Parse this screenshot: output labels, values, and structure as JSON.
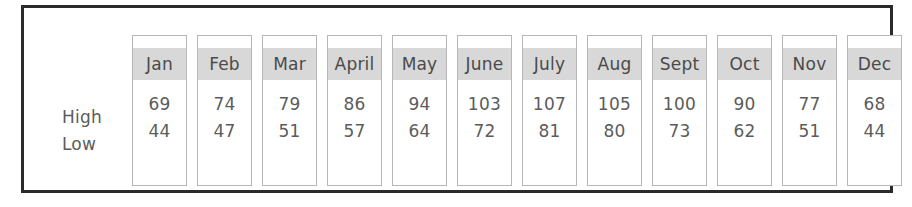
{
  "table": {
    "row_labels": [
      "High",
      "Low"
    ],
    "months": [
      "Jan",
      "Feb",
      "Mar",
      "April",
      "May",
      "June",
      "July",
      "Aug",
      "Sept",
      "Oct",
      "Nov",
      "Dec"
    ],
    "rows": {
      "high": [
        69,
        74,
        79,
        86,
        94,
        103,
        107,
        105,
        100,
        90,
        77,
        68
      ],
      "low": [
        44,
        47,
        51,
        57,
        64,
        72,
        81,
        80,
        73,
        62,
        51,
        44
      ]
    }
  },
  "colors": {
    "frame_border": "#2b2b2b",
    "column_border": "#b7b7b7",
    "header_fill": "#d8d8d8",
    "text": "#5c5c5c",
    "background": "#ffffff"
  },
  "chart_data": {
    "type": "table",
    "title": "",
    "categories": [
      "Jan",
      "Feb",
      "Mar",
      "April",
      "May",
      "June",
      "July",
      "Aug",
      "Sept",
      "Oct",
      "Nov",
      "Dec"
    ],
    "series": [
      {
        "name": "High",
        "values": [
          69,
          74,
          79,
          86,
          94,
          103,
          107,
          105,
          100,
          90,
          77,
          68
        ]
      },
      {
        "name": "Low",
        "values": [
          44,
          47,
          51,
          57,
          64,
          72,
          81,
          80,
          73,
          62,
          51,
          44
        ]
      }
    ],
    "xlabel": "",
    "ylabel": "",
    "legend": [
      "High",
      "Low"
    ],
    "grid": false
  }
}
